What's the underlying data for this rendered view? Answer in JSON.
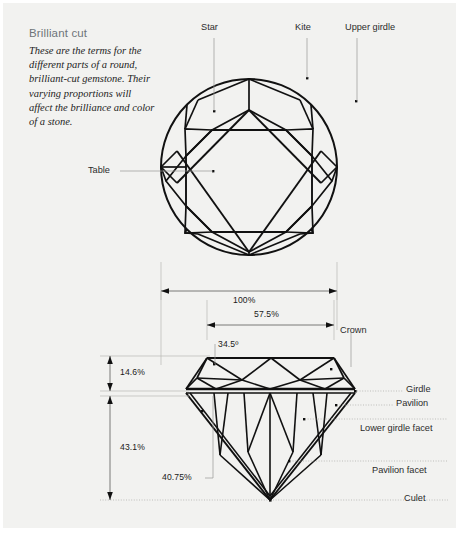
{
  "figure": {
    "title": "Brilliant cut",
    "description": "These are the terms for the different parts of a round, brilliant-cut gemstone. Their varying proportions will affect the brilliance and color of a stone.",
    "background_color": "#f2f2f0",
    "line_color": "#111111",
    "title_color": "#6e7479"
  },
  "top_view": {
    "name": "round brilliant cut - table up view",
    "labels": [
      {
        "id": "star",
        "text": "Star"
      },
      {
        "id": "kite",
        "text": "Kite"
      },
      {
        "id": "upper-girdle",
        "text": "Upper girdle"
      },
      {
        "id": "table",
        "text": "Table"
      }
    ]
  },
  "dimensions": {
    "diameter": "100%",
    "table_width": "57.5%",
    "crown_angle": "34.5º",
    "crown_height": "14.6%",
    "pavilion_depth": "43.1%",
    "lower_girdle_length": "40.75%"
  },
  "side_view": {
    "name": "round brilliant cut - profile view",
    "labels": [
      {
        "id": "crown",
        "text": "Crown"
      },
      {
        "id": "girdle",
        "text": "Girdle"
      },
      {
        "id": "pavilion",
        "text": "Pavilion"
      },
      {
        "id": "lower-girdle-facet",
        "text": "Lower girdle facet"
      },
      {
        "id": "pavilion-facet",
        "text": "Pavilion facet"
      },
      {
        "id": "culet",
        "text": "Culet"
      }
    ]
  }
}
